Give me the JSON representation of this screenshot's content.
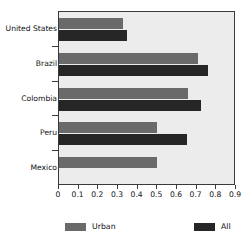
{
  "chart_data": {
    "type": "bar",
    "orientation": "horizontal",
    "title": "",
    "xlabel": "",
    "ylabel": "",
    "categories": [
      "United States",
      "Brazil",
      "Colombia",
      "Peru",
      "Mexico"
    ],
    "series": [
      {
        "name": "Urban",
        "color": "#6a6a6a",
        "values": [
          0.325,
          0.705,
          0.655,
          0.5,
          0.5
        ]
      },
      {
        "name": "All",
        "color": "#262626",
        "values": [
          0.345,
          0.76,
          0.72,
          0.65,
          null
        ]
      }
    ],
    "xlim": [
      0,
      0.9
    ],
    "xticks": [
      0,
      0.1,
      0.2,
      0.3,
      0.4,
      0.5,
      0.6,
      0.7,
      0.8,
      0.9
    ],
    "xticklabels": [
      "0",
      "0.1",
      "0.2",
      "0.3",
      "0.4",
      "0.5",
      "0.6",
      "0.7",
      "0.8",
      "0.9"
    ],
    "grid": false,
    "legend_position": "bottom",
    "plot_background": "#ececec",
    "frame_color": "#3a3a3a"
  },
  "legend": {
    "entries": [
      {
        "label": "Urban",
        "color": "#6a6a6a"
      },
      {
        "label": "All",
        "color": "#262626"
      }
    ]
  }
}
